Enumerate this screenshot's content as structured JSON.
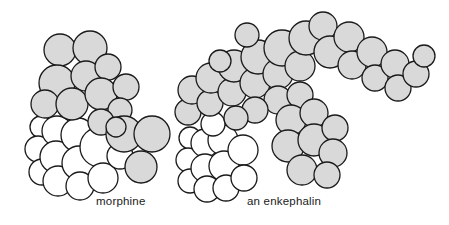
{
  "figure": {
    "type": "molecular-space-filling-model-diagram",
    "background_color": "#ffffff",
    "outline_color": "#1a1a1a",
    "gray_fill_color": "#d9d9d9",
    "white_fill_color": "#ffffff",
    "width": 449,
    "height": 225
  },
  "molecules": [
    {
      "id": "morphine",
      "label": "morphine",
      "label_x": 96,
      "label_y": 195,
      "description": "compact space-filling model, gray spheres upper portion, white spheres lower-left portion"
    },
    {
      "id": "enkephalin",
      "label": "an enkephalin",
      "label_x": 247,
      "label_y": 195,
      "description": "larger arch-shaped space-filling model with gray spheres forming a curve and a horizontal tail to the right, white spheres at lower-left"
    }
  ],
  "chart_data": {
    "type": "scatter",
    "title": "",
    "xlabel": "",
    "ylabel": "",
    "legend": [],
    "series": [
      {
        "name": "morphine-white-spheres",
        "fill": "#ffffff",
        "atoms": [
          {
            "cx": 41,
            "cy": 127,
            "r": 11
          },
          {
            "cx": 38,
            "cy": 149,
            "r": 13
          },
          {
            "cx": 42,
            "cy": 172,
            "r": 13
          },
          {
            "cx": 57,
            "cy": 131,
            "r": 15
          },
          {
            "cx": 56,
            "cy": 157,
            "r": 16
          },
          {
            "cx": 58,
            "cy": 181,
            "r": 15
          },
          {
            "cx": 78,
            "cy": 135,
            "r": 17
          },
          {
            "cx": 79,
            "cy": 163,
            "r": 17
          },
          {
            "cx": 80,
            "cy": 186,
            "r": 14
          },
          {
            "cx": 100,
            "cy": 147,
            "r": 20
          },
          {
            "cx": 103,
            "cy": 178,
            "r": 15
          },
          {
            "cx": 120,
            "cy": 156,
            "r": 13
          }
        ]
      },
      {
        "name": "morphine-gray-spheres",
        "fill": "#d9d9d9",
        "atoms": [
          {
            "cx": 60,
            "cy": 50,
            "r": 16
          },
          {
            "cx": 90,
            "cy": 48,
            "r": 17
          },
          {
            "cx": 57,
            "cy": 83,
            "r": 18
          },
          {
            "cx": 86,
            "cy": 76,
            "r": 15
          },
          {
            "cx": 108,
            "cy": 67,
            "r": 13
          },
          {
            "cx": 45,
            "cy": 104,
            "r": 14
          },
          {
            "cx": 72,
            "cy": 104,
            "r": 16
          },
          {
            "cx": 101,
            "cy": 94,
            "r": 16
          },
          {
            "cx": 126,
            "cy": 87,
            "r": 13
          },
          {
            "cx": 120,
            "cy": 110,
            "r": 12
          },
          {
            "cx": 101,
            "cy": 122,
            "r": 13
          },
          {
            "cx": 124,
            "cy": 134,
            "r": 18
          },
          {
            "cx": 152,
            "cy": 134,
            "r": 18
          },
          {
            "cx": 141,
            "cy": 167,
            "r": 16
          },
          {
            "cx": 116,
            "cy": 127,
            "r": 10
          }
        ]
      },
      {
        "name": "enkephalin-white-spheres",
        "fill": "#ffffff",
        "atoms": [
          {
            "cx": 190,
            "cy": 138,
            "r": 11
          },
          {
            "cx": 188,
            "cy": 160,
            "r": 12
          },
          {
            "cx": 190,
            "cy": 181,
            "r": 12
          },
          {
            "cx": 205,
            "cy": 143,
            "r": 14
          },
          {
            "cx": 205,
            "cy": 168,
            "r": 14
          },
          {
            "cx": 207,
            "cy": 189,
            "r": 13
          },
          {
            "cx": 223,
            "cy": 140,
            "r": 15
          },
          {
            "cx": 224,
            "cy": 166,
            "r": 15
          },
          {
            "cx": 226,
            "cy": 188,
            "r": 13
          },
          {
            "cx": 243,
            "cy": 150,
            "r": 15
          },
          {
            "cx": 244,
            "cy": 178,
            "r": 13
          },
          {
            "cx": 213,
            "cy": 124,
            "r": 12
          }
        ]
      },
      {
        "name": "enkephalin-gray-spheres",
        "fill": "#d9d9d9",
        "atoms": [
          {
            "cx": 188,
            "cy": 112,
            "r": 13
          },
          {
            "cx": 192,
            "cy": 90,
            "r": 14
          },
          {
            "cx": 210,
            "cy": 103,
            "r": 13
          },
          {
            "cx": 211,
            "cy": 78,
            "r": 15
          },
          {
            "cx": 232,
            "cy": 92,
            "r": 14
          },
          {
            "cx": 234,
            "cy": 66,
            "r": 16
          },
          {
            "cx": 255,
            "cy": 83,
            "r": 15
          },
          {
            "cx": 258,
            "cy": 57,
            "r": 17
          },
          {
            "cx": 278,
            "cy": 74,
            "r": 15
          },
          {
            "cx": 282,
            "cy": 48,
            "r": 18
          },
          {
            "cx": 300,
            "cy": 66,
            "r": 15
          },
          {
            "cx": 306,
            "cy": 38,
            "r": 17
          },
          {
            "cx": 323,
            "cy": 26,
            "r": 14
          },
          {
            "cx": 330,
            "cy": 52,
            "r": 16
          },
          {
            "cx": 349,
            "cy": 37,
            "r": 15
          },
          {
            "cx": 352,
            "cy": 65,
            "r": 14
          },
          {
            "cx": 372,
            "cy": 52,
            "r": 15
          },
          {
            "cx": 375,
            "cy": 78,
            "r": 13
          },
          {
            "cx": 395,
            "cy": 64,
            "r": 14
          },
          {
            "cx": 398,
            "cy": 88,
            "r": 13
          },
          {
            "cx": 416,
            "cy": 74,
            "r": 13
          },
          {
            "cx": 424,
            "cy": 56,
            "r": 11
          },
          {
            "cx": 278,
            "cy": 100,
            "r": 14
          },
          {
            "cx": 300,
            "cy": 95,
            "r": 13
          },
          {
            "cx": 291,
            "cy": 120,
            "r": 15
          },
          {
            "cx": 314,
            "cy": 113,
            "r": 14
          },
          {
            "cx": 288,
            "cy": 146,
            "r": 16
          },
          {
            "cx": 314,
            "cy": 140,
            "r": 16
          },
          {
            "cx": 335,
            "cy": 128,
            "r": 13
          },
          {
            "cx": 333,
            "cy": 153,
            "r": 14
          },
          {
            "cx": 302,
            "cy": 170,
            "r": 15
          },
          {
            "cx": 327,
            "cy": 175,
            "r": 13
          },
          {
            "cx": 255,
            "cy": 110,
            "r": 13
          },
          {
            "cx": 236,
            "cy": 118,
            "r": 12
          },
          {
            "cx": 220,
            "cy": 61,
            "r": 11
          },
          {
            "cx": 247,
            "cy": 35,
            "r": 12
          }
        ]
      }
    ]
  }
}
